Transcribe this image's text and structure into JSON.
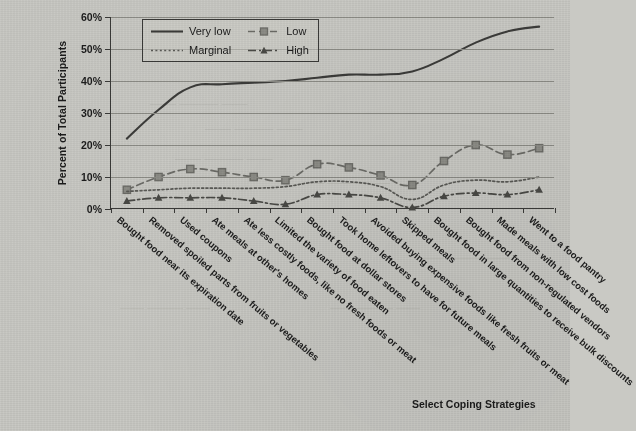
{
  "chart_data": {
    "type": "line",
    "title": "",
    "xlabel": "Select Coping Strategies",
    "ylabel": "Percent of  Total Participants",
    "ylim": [
      0,
      60
    ],
    "ytick_labels": [
      "0%",
      "10%",
      "20%",
      "30%",
      "40%",
      "50%",
      "60%"
    ],
    "ytick_values": [
      0,
      10,
      20,
      30,
      40,
      50,
      60
    ],
    "grid": true,
    "legend_position": "top-left-inside",
    "categories": [
      "Bought food near its expiration date",
      "Removed spoiled parts from fruits or vegetables",
      "Used coupons",
      "Ate meals at other's homes",
      "Ate less costly foods, like no fresh foods or meat",
      "Limited the variety of food eaten",
      "Bought food at dollar stores",
      "Took home leftovers to have for future meals",
      "Avoided buying expensive foods like fresh fruits or meat",
      "Skipped meals",
      "Bought food in large quantities to receive bulk discounts",
      "Bought food from non-regulated vendors",
      "Made meals with low cost foods",
      "Went to a food pantry"
    ],
    "series": [
      {
        "name": "Very low",
        "style": "solid",
        "marker": "none",
        "color": "#3c3c3a",
        "values": [
          22,
          31,
          38,
          39,
          39.5,
          40,
          41,
          42,
          42,
          43,
          47,
          52,
          55.5,
          57
        ]
      },
      {
        "name": "Low",
        "style": "dashed",
        "marker": "square",
        "color": "#6d6d68",
        "values": [
          6,
          10,
          12.5,
          11.5,
          10,
          9,
          14,
          13,
          10.5,
          7.5,
          15,
          20,
          17,
          19
        ]
      },
      {
        "name": "Marginal",
        "style": "dotted",
        "marker": "none",
        "color": "#5a5a56",
        "values": [
          5.5,
          6,
          6.5,
          6.5,
          6.5,
          7,
          8.5,
          8.5,
          7,
          3,
          7.5,
          9,
          8.5,
          10
        ]
      },
      {
        "name": "High",
        "style": "dashdot",
        "marker": "triangle",
        "color": "#4a4a46",
        "values": [
          2.5,
          3.5,
          3.5,
          3.5,
          2.5,
          1.5,
          4.5,
          4.5,
          3.5,
          0.5,
          4,
          5,
          4.5,
          6
        ]
      }
    ]
  },
  "axes": {
    "y_title": "Percent of  Total Participants",
    "x_title": "Select Coping Strategies"
  },
  "legend": {
    "items": [
      {
        "label": "Very low"
      },
      {
        "label": "Low"
      },
      {
        "label": "Marginal"
      },
      {
        "label": "High"
      }
    ]
  }
}
